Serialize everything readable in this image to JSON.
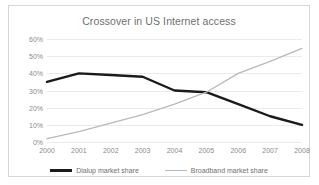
{
  "chart_data": {
    "type": "line",
    "title": "Crossover in US Internet access",
    "xlabel": "",
    "ylabel": "",
    "x": [
      "2000",
      "2001",
      "2002",
      "2003",
      "2004",
      "2005",
      "2006",
      "2007",
      "2008"
    ],
    "categories": [
      "2000",
      "2001",
      "2002",
      "2003",
      "2004",
      "2005",
      "2006",
      "2007",
      "2008"
    ],
    "ylim": [
      0,
      60
    ],
    "yticks": [
      0,
      10,
      20,
      30,
      40,
      50,
      60
    ],
    "ytick_labels": [
      "0%",
      "10%",
      "20%",
      "30%",
      "40%",
      "50%",
      "60%"
    ],
    "grid": true,
    "legend_position": "bottom",
    "series": [
      {
        "name": "Dialup market share",
        "color": "#1a1a1a",
        "values": [
          35,
          40,
          39,
          38,
          30,
          29,
          22,
          15,
          10
        ]
      },
      {
        "name": "Broadband market share",
        "color": "#b9b9b9",
        "values": [
          2,
          6,
          11,
          16,
          22,
          29,
          40,
          47,
          54.5
        ]
      }
    ]
  },
  "colors": {
    "dialup": "#1a1a1a",
    "broadband": "#b9b9b9",
    "gridline": "#ebebeb",
    "text": "#6f6f6f",
    "tick_text": "#8a8a8a",
    "border": "#d6d6d6",
    "background": "#ffffff"
  }
}
